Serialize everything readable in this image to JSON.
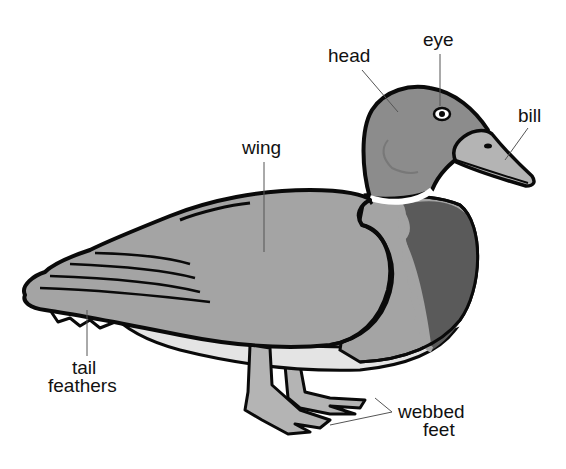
{
  "diagram": {
    "labels": {
      "head": "head",
      "eye": "eye",
      "bill": "bill",
      "wing": "wing",
      "tail_line1": "tail",
      "tail_line2": "feathers",
      "feet_line1": "webbed",
      "feet_line2": "feet"
    },
    "colors": {
      "outline": "#0a0a0a",
      "head": "#8c8c8c",
      "body": "#a4a4a4",
      "chest": "#5a5a5a",
      "bill": "#b4b4b4",
      "legs": "#b4b4b4",
      "belly": "#e4e4e4",
      "collar": "#ffffff",
      "leader": "#555555"
    }
  }
}
